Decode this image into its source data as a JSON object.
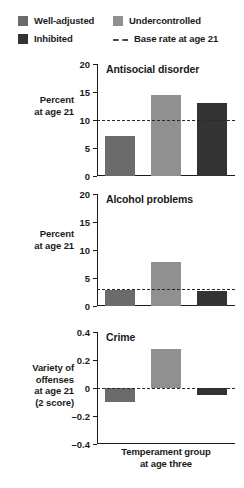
{
  "legend": {
    "entries": [
      {
        "label": "Well-adjusted",
        "color": "#6b6b6b",
        "type": "swatch"
      },
      {
        "label": "Undercontrolled",
        "color": "#909090",
        "type": "swatch"
      },
      {
        "label": "Inhibited",
        "color": "#333333",
        "type": "swatch"
      },
      {
        "label": "Base rate at age 21",
        "color": "#4a4a4a",
        "type": "dashed-line"
      }
    ]
  },
  "axis": {
    "xlabel_line1": "Temperament group",
    "xlabel_line2": "at age three"
  },
  "chart_data": [
    {
      "type": "bar",
      "title": "Antisocial disorder",
      "ylabel": "Percent\nat age 21",
      "ylabel_line1": "Percent",
      "ylabel_line2": "at age 21",
      "categories": [
        "Well-adjusted",
        "Undercontrolled",
        "Inhibited"
      ],
      "values": [
        7.2,
        14.5,
        13.0
      ],
      "colors": [
        "#6b6b6b",
        "#909090",
        "#333333"
      ],
      "ylim": [
        0,
        20
      ],
      "yticks": [
        0,
        5,
        10,
        15,
        20
      ],
      "ytick_labels": [
        "0",
        "5",
        "10",
        "15",
        "20"
      ],
      "base_rate": 10.0,
      "grid": false
    },
    {
      "type": "bar",
      "title": "Alcohol problems",
      "ylabel": "Percent\nat age 21",
      "ylabel_line1": "Percent",
      "ylabel_line2": "at age 21",
      "categories": [
        "Well-adjusted",
        "Undercontrolled",
        "Inhibited"
      ],
      "values": [
        2.8,
        7.9,
        2.6
      ],
      "colors": [
        "#6b6b6b",
        "#909090",
        "#333333"
      ],
      "ylim": [
        0,
        20
      ],
      "yticks": [
        0,
        5,
        10,
        15,
        20
      ],
      "ytick_labels": [
        "0",
        "5",
        "10",
        "15",
        "20"
      ],
      "base_rate": 3.0,
      "grid": false
    },
    {
      "type": "bar",
      "title": "Crime",
      "ylabel": "Variety of\noffenses\nat age 21\n(2 score)",
      "ylabel_line1": "Variety of",
      "ylabel_line2": "offenses",
      "ylabel_line3": "at age 21",
      "ylabel_line4": "(2 score)",
      "categories": [
        "Well-adjusted",
        "Undercontrolled",
        "Inhibited"
      ],
      "values": [
        -0.1,
        0.28,
        -0.05
      ],
      "colors": [
        "#6b6b6b",
        "#909090",
        "#333333"
      ],
      "ylim": [
        -0.4,
        0.4
      ],
      "yticks": [
        -0.4,
        -0.2,
        0,
        0.2,
        0.4
      ],
      "ytick_labels": [
        "–0.4",
        "–0.2",
        "0",
        "0.2",
        "0.4"
      ],
      "base_rate": 0.0,
      "grid": false
    }
  ]
}
